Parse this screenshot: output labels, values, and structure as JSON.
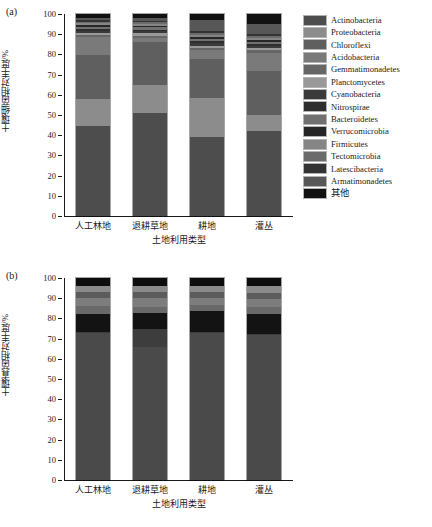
{
  "figure": {
    "panels": [
      {
        "tag": "(a)",
        "ylabel": "土壤细菌相对丰度/%",
        "xlabel": "土地利用类型"
      },
      {
        "tag": "(b)",
        "ylabel": "土壤真菌相对丰度/%",
        "xlabel": "土地利用类型"
      }
    ],
    "ytick_labels": [
      "0",
      "10",
      "20",
      "30",
      "40",
      "50",
      "60",
      "70",
      "80",
      "90",
      "100"
    ]
  },
  "chart_data": [
    {
      "type": "bar",
      "stacked": true,
      "title": "(a) 土壤细菌群落组成",
      "xlabel": "土地利用类型",
      "ylabel": "土壤细菌相对丰度/%",
      "ylim": [
        0,
        100
      ],
      "yticks": [
        0,
        10,
        20,
        30,
        40,
        50,
        60,
        70,
        80,
        90,
        100
      ],
      "grid": false,
      "legend_position": "right",
      "categories": [
        "人工林地",
        "退耕草地",
        "耕地",
        "灌丛"
      ],
      "series": [
        {
          "name": "Actinobacteria",
          "color": "#4d4d4d",
          "values": [
            44.6,
            51.1,
            39.0,
            42.0
          ]
        },
        {
          "name": "Proteobacteria",
          "color": "#8c8c8c",
          "values": [
            13.3,
            13.8,
            19.5,
            8.0
          ]
        },
        {
          "name": "Chloroflexi",
          "color": "#5f5f5f",
          "values": [
            21.6,
            21.2,
            19.0,
            22.0
          ]
        },
        {
          "name": "Acidobacteria",
          "color": "#7a7a7a",
          "values": [
            9.0,
            2.0,
            4.5,
            8.5
          ]
        },
        {
          "name": "Gemmatimonadetes",
          "color": "#666666",
          "values": [
            1.2,
            1.2,
            1.3,
            1.5
          ]
        },
        {
          "name": "Planctomycetes",
          "color": "#999999",
          "values": [
            1.0,
            1.1,
            1.0,
            1.2
          ]
        },
        {
          "name": "Cyanobacteria",
          "color": "#3a3a3a",
          "values": [
            1.1,
            1.0,
            1.2,
            1.0
          ]
        },
        {
          "name": "Nitrospirae",
          "color": "#2e2e2e",
          "values": [
            0.9,
            0.9,
            1.0,
            1.0
          ]
        },
        {
          "name": "Bacteroidetes",
          "color": "#707070",
          "values": [
            1.0,
            1.1,
            1.2,
            1.1
          ]
        },
        {
          "name": "Verrucomicrobia",
          "color": "#262626",
          "values": [
            0.9,
            0.9,
            1.0,
            1.0
          ]
        },
        {
          "name": "Firmicutes",
          "color": "#858585",
          "values": [
            0.8,
            0.9,
            1.0,
            1.0
          ]
        },
        {
          "name": "Tectomicrobia",
          "color": "#6b6b6b",
          "values": [
            0.8,
            0.8,
            0.9,
            0.9
          ]
        },
        {
          "name": "Latescibacteria",
          "color": "#333333",
          "values": [
            0.8,
            0.8,
            0.9,
            0.9
          ]
        },
        {
          "name": "Armatimonadetes",
          "color": "#575757",
          "values": [
            1.0,
            1.2,
            5.5,
            4.9
          ]
        },
        {
          "name": "其他",
          "color": "#111111",
          "values": [
            2.0,
            2.0,
            3.0,
            5.0
          ]
        }
      ]
    },
    {
      "type": "bar",
      "stacked": true,
      "title": "(b) 土壤真菌群落组成",
      "xlabel": "土地利用类型",
      "ylabel": "土壤真菌相对丰度/%",
      "ylim": [
        0,
        100
      ],
      "yticks": [
        0,
        10,
        20,
        30,
        40,
        50,
        60,
        70,
        80,
        90,
        100
      ],
      "grid": false,
      "legend_position": "right",
      "categories": [
        "人工林地",
        "退耕草地",
        "耕地",
        "灌丛"
      ],
      "series": [
        {
          "name": "Ascomycota",
          "color": "#4a4a4a",
          "values": [
            73.0,
            66.0,
            73.0,
            72.0
          ]
        },
        {
          "name": "Basidiomycota",
          "color": "#3d3d3d",
          "values": [
            0.5,
            9.0,
            0.5,
            0.5
          ]
        },
        {
          "name": "Zygomycota",
          "color": "#131313",
          "values": [
            8.5,
            7.5,
            10.0,
            9.5
          ]
        },
        {
          "name": "Glomeromycota",
          "color": "#696969",
          "values": [
            4.0,
            3.0,
            3.0,
            3.5
          ]
        },
        {
          "name": "Ghytridiomycota",
          "color": "#7d7d7d",
          "values": [
            4.0,
            4.5,
            3.5,
            4.0
          ]
        },
        {
          "name": "Neocallimastigomycota",
          "color": "#5c5c5c",
          "values": [
            3.0,
            3.0,
            3.0,
            3.0
          ]
        },
        {
          "name": "Rozellomycota",
          "color": "#8a8a8a",
          "values": [
            3.0,
            3.0,
            3.0,
            3.5
          ]
        },
        {
          "name": "其他",
          "color": "#0d0d0d",
          "values": [
            4.0,
            4.0,
            4.0,
            4.0
          ]
        }
      ]
    }
  ]
}
